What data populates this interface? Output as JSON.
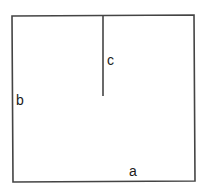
{
  "diagram": {
    "type": "rectangle-with-partition",
    "stroke_color": "#444444",
    "background": "#ffffff",
    "rectangle": {
      "x": 12,
      "y": 16,
      "width": 183,
      "height": 165
    },
    "partition": {
      "x": 103,
      "y1": 16,
      "y2": 96
    },
    "labels": {
      "a": "a",
      "b": "b",
      "c": "c"
    }
  }
}
